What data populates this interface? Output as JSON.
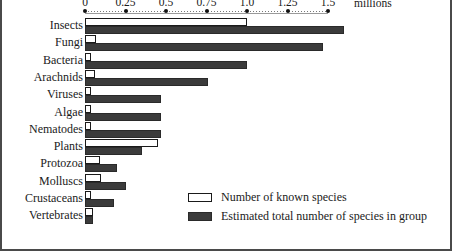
{
  "chart_data": {
    "type": "bar",
    "orientation": "horizontal",
    "title": "",
    "xlabel": "millions",
    "ylabel": "",
    "xlim": [
      0,
      1.75
    ],
    "grid": false,
    "legend_position": "bottom-right",
    "axis_unit_label": "millions",
    "tick_labels": [
      "0",
      "0.25",
      "0.5",
      "0.75",
      "1.0",
      "1.25",
      "1.5"
    ],
    "tick_values": [
      0,
      0.25,
      0.5,
      0.75,
      1.0,
      1.25,
      1.5
    ],
    "categories": [
      "Insects",
      "Fungi",
      "Bacteria",
      "Arachnids",
      "Viruses",
      "Algae",
      "Nematodes",
      "Plants",
      "Protozoa",
      "Molluscs",
      "Crustaceans",
      "Vertebrates"
    ],
    "series": [
      {
        "name": "Number of known species",
        "color": "#ffffff",
        "values": [
          1.0,
          0.07,
          0.005,
          0.06,
          0.005,
          0.04,
          0.015,
          0.45,
          0.09,
          0.1,
          0.04,
          0.05
        ]
      },
      {
        "name": "Estimated total number of species in group",
        "color": "#3b3b3b",
        "values": [
          1.6,
          1.47,
          1.0,
          0.76,
          0.47,
          0.47,
          0.47,
          0.35,
          0.2,
          0.25,
          0.18,
          0.05
        ]
      }
    ]
  },
  "legend": {
    "items": [
      {
        "label": "Number of known species",
        "swatch": "known"
      },
      {
        "label": "Estimated total number of species in group",
        "swatch": "total"
      }
    ]
  }
}
